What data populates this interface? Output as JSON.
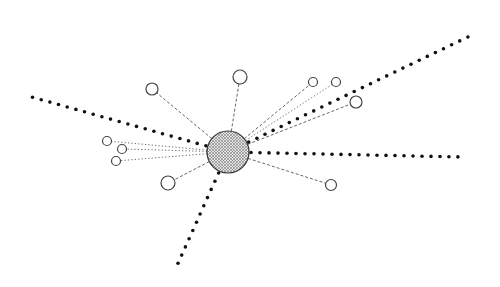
{
  "diagram": {
    "type": "radial-hub-network",
    "width": 500,
    "height": 287,
    "colors": {
      "background": "#ffffff",
      "stroke": "#333333",
      "dot": "#111111",
      "hub_fill": "#d8d8d8"
    },
    "hub": {
      "cx": 228,
      "cy": 152,
      "r": 21,
      "fill_pattern": "crosshatch"
    },
    "heavy_dotted_rays": [
      {
        "x1": 228,
        "y1": 152,
        "x2": 28,
        "y2": 96
      },
      {
        "x1": 228,
        "y1": 152,
        "x2": 472,
        "y2": 35
      },
      {
        "x1": 228,
        "y1": 152,
        "x2": 461,
        "y2": 157
      },
      {
        "x1": 228,
        "y1": 152,
        "x2": 175,
        "y2": 270
      }
    ],
    "satellites": [
      {
        "cx": 152,
        "cy": 89,
        "r": 6,
        "link": "dashed"
      },
      {
        "cx": 240,
        "cy": 77,
        "r": 7,
        "link": "dashed"
      },
      {
        "cx": 313,
        "cy": 82,
        "r": 4.5,
        "link": "dashed"
      },
      {
        "cx": 336,
        "cy": 82,
        "r": 4.5,
        "link": "dotted"
      },
      {
        "cx": 356,
        "cy": 102,
        "r": 6,
        "link": "dashed"
      },
      {
        "cx": 107,
        "cy": 141,
        "r": 4.5,
        "link": "dotted"
      },
      {
        "cx": 122,
        "cy": 149,
        "r": 4.5,
        "link": "dotted"
      },
      {
        "cx": 116,
        "cy": 161,
        "r": 4.5,
        "link": "dotted"
      },
      {
        "cx": 168,
        "cy": 183,
        "r": 7,
        "link": "dashed"
      },
      {
        "cx": 331,
        "cy": 185,
        "r": 5.5,
        "link": "dashed"
      }
    ]
  }
}
